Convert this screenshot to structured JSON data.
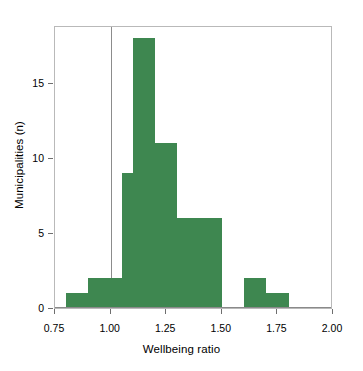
{
  "chart_data": {
    "type": "bar",
    "title": "",
    "subtitle": "",
    "xlabel": "Wellbeing ratio",
    "ylabel": "Municipalities (n)",
    "xlim": [
      0.75,
      2.0
    ],
    "ylim": [
      0,
      18.8
    ],
    "grid": false,
    "legend": null,
    "bin_width": 0.05,
    "bin_starts": [
      0.8,
      0.9,
      1.05,
      1.1,
      1.2,
      1.3,
      1.6,
      1.7
    ],
    "categories": [
      "0.80",
      "0.90",
      "1.05",
      "1.10",
      "1.20",
      "1.30",
      "1.60",
      "1.70"
    ],
    "values": [
      1,
      2,
      9,
      18,
      11,
      6,
      2,
      1
    ],
    "bars": [
      {
        "x0": 0.8,
        "x1": 0.9,
        "value": 1
      },
      {
        "x0": 0.9,
        "x1": 1.05,
        "value": 2
      },
      {
        "x0": 1.05,
        "x1": 1.1,
        "value": 9
      },
      {
        "x0": 1.1,
        "x1": 1.2,
        "value": 18
      },
      {
        "x0": 1.2,
        "x1": 1.3,
        "value": 11
      },
      {
        "x0": 1.3,
        "x1": 1.5,
        "value": 6
      },
      {
        "x0": 1.6,
        "x1": 1.7,
        "value": 2
      },
      {
        "x0": 1.7,
        "x1": 1.8,
        "value": 1
      }
    ],
    "xticks": [
      0.75,
      1.0,
      1.25,
      1.5,
      1.75,
      2.0
    ],
    "xtick_labels": [
      "0.75",
      "1.00",
      "1.25",
      "1.50",
      "1.75",
      "2.00"
    ],
    "yticks": [
      0,
      5,
      10,
      15
    ],
    "ytick_labels": [
      "0",
      "5",
      "10",
      "15"
    ],
    "annotations": [
      {
        "name": "reference-line",
        "type": "vline",
        "x": 1.0,
        "color": "#8c8c8c"
      }
    ],
    "colors": {
      "bar_fill": "#3e8750",
      "reference_line": "#8c8c8c",
      "frame": "#b9b9b9",
      "text": "#000000",
      "tick": "#6e6e6e",
      "background": "#ffffff"
    }
  }
}
